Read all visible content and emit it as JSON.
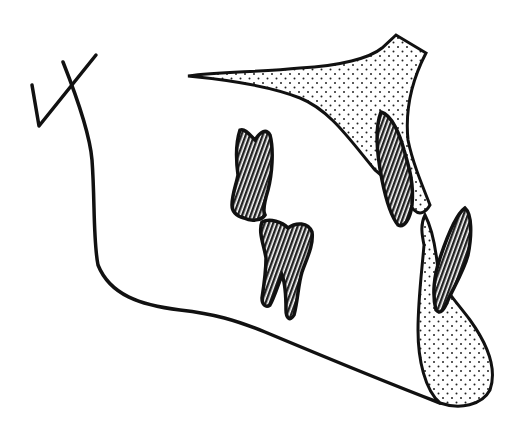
{
  "figure": {
    "title": "",
    "colors": {
      "background": "#ffffff",
      "stroke": "#111111",
      "tooth_fill": "#6e6e6e",
      "stipple_bg": "#ffffff",
      "stipple_dot": "#222222"
    },
    "elements": [
      {
        "name": "mandible-outline",
        "type": "line"
      },
      {
        "name": "condyle-marker",
        "type": "line"
      },
      {
        "name": "maxilla-palate",
        "type": "stippled-region"
      },
      {
        "name": "symphysis",
        "type": "stippled-region"
      },
      {
        "name": "upper-molar",
        "type": "hatched-tooth"
      },
      {
        "name": "lower-molar",
        "type": "hatched-tooth"
      },
      {
        "name": "upper-incisor",
        "type": "hatched-tooth"
      },
      {
        "name": "lower-incisor",
        "type": "hatched-tooth"
      }
    ]
  }
}
